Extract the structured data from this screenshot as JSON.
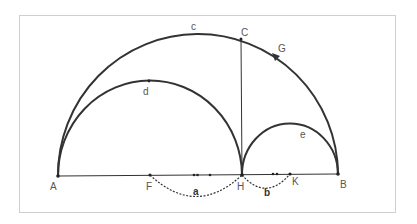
{
  "figure": {
    "frame": {
      "x": 19,
      "y": 15,
      "width": 376,
      "height": 197,
      "stroke": "#cfcfcf"
    },
    "colors": {
      "curve": "#333333",
      "dashed": "#333333",
      "label": "#555555"
    },
    "points": {
      "A": {
        "label": "A",
        "x": 58,
        "y": 176
      },
      "F": {
        "label": "F",
        "x": 150,
        "y": 175
      },
      "H": {
        "label": "H",
        "x": 242,
        "y": 175
      },
      "K": {
        "label": "K",
        "x": 290,
        "y": 174
      },
      "B": {
        "label": "B",
        "x": 338,
        "y": 174
      },
      "C": {
        "label": "C",
        "x": 241,
        "y": 39
      },
      "G": {
        "label": "G",
        "x": 276,
        "y": 57
      }
    },
    "arcs": {
      "c": {
        "label": "c"
      },
      "d": {
        "label": "d"
      },
      "e": {
        "label": "e"
      },
      "a": {
        "label": "a"
      },
      "b": {
        "label": "b"
      }
    }
  }
}
